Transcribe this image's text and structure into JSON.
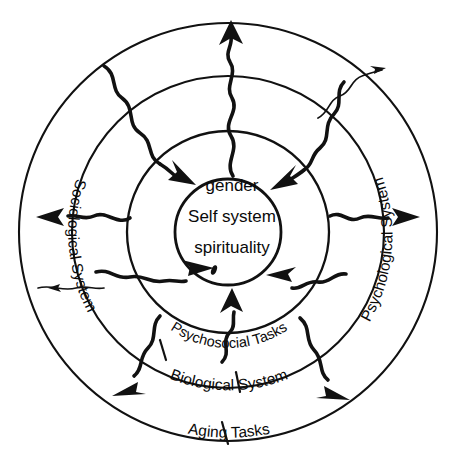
{
  "header": {
    "running_head": "",
    "page_marker": ""
  },
  "diagram": {
    "center": {
      "lines": [
        "gender",
        "Self system",
        "spirituality"
      ]
    },
    "rings": [
      {
        "id": "core",
        "label": "",
        "radius": 53
      },
      {
        "id": "psychosocial",
        "label": "Psychosocial Tasks",
        "radius": 100
      },
      {
        "id": "biological",
        "label": "Biological System",
        "radius": 156
      },
      {
        "id": "aging",
        "label": "Aging Tasks",
        "radius": 210
      }
    ],
    "side_labels": [
      {
        "id": "sociological",
        "label": "Sociological System",
        "side": "left"
      },
      {
        "id": "psychological",
        "label": "Psychological System",
        "side": "right"
      }
    ],
    "colors": {
      "ink": "#111111",
      "background": "#ffffff",
      "faded_text": "#c9c9c9"
    },
    "arrow_count_inward": 4,
    "arrow_count_outward": 4
  }
}
